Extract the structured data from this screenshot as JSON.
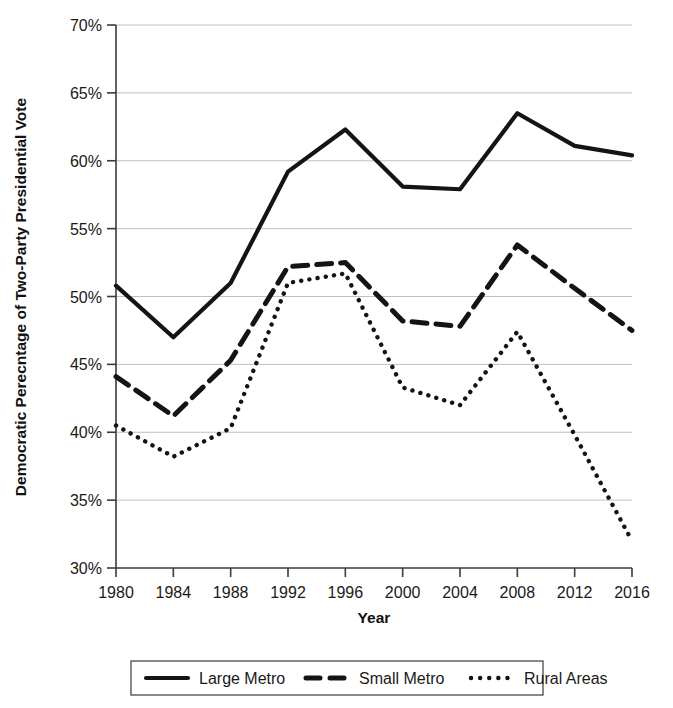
{
  "chart_data": {
    "type": "line",
    "title": "",
    "xlabel": "Year",
    "ylabel": "Democratic Perecntage of Two-Party Presidential Vote",
    "categories": [
      "1980",
      "1984",
      "1988",
      "1992",
      "1996",
      "2000",
      "2004",
      "2008",
      "2012",
      "2016"
    ],
    "x": [
      1980,
      1984,
      1988,
      1992,
      1996,
      2000,
      2004,
      2008,
      2012,
      2016
    ],
    "xlim": [
      1980,
      2016
    ],
    "ylim": [
      30,
      70
    ],
    "ytick_labels": [
      "30%",
      "35%",
      "40%",
      "45%",
      "50%",
      "55%",
      "60%",
      "65%",
      "70%"
    ],
    "ytick_values": [
      30,
      35,
      40,
      45,
      50,
      55,
      60,
      65,
      70
    ],
    "grid": true,
    "legend_position": "bottom",
    "series": [
      {
        "name": "Large Metro",
        "style": "solid",
        "color": "#141414",
        "values": [
          50.8,
          47.0,
          51.0,
          59.2,
          62.3,
          58.1,
          57.9,
          63.5,
          61.1,
          60.4
        ]
      },
      {
        "name": "Small Metro",
        "style": "dashed",
        "color": "#141414",
        "values": [
          44.1,
          41.2,
          45.3,
          52.2,
          52.5,
          48.2,
          47.8,
          53.8,
          50.6,
          47.5
        ]
      },
      {
        "name": "Rural Areas",
        "style": "dotted",
        "color": "#141414",
        "values": [
          40.5,
          38.2,
          40.3,
          51.0,
          51.7,
          43.3,
          42.0,
          47.4,
          39.8,
          32.0
        ]
      }
    ]
  },
  "legend": {
    "items": [
      {
        "label": "Large Metro",
        "style": "solid"
      },
      {
        "label": "Small Metro",
        "style": "dashed"
      },
      {
        "label": "Rural Areas",
        "style": "dotted"
      }
    ]
  },
  "axes": {
    "x_title": "Year",
    "y_title": "Democratic Perecntage of Two-Party Presidential Vote"
  }
}
